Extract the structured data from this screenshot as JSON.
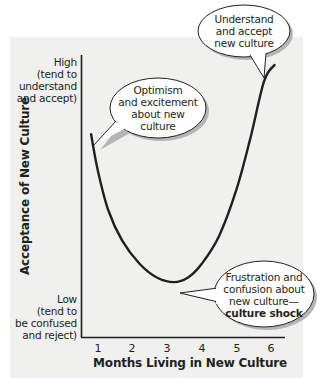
{
  "chart_data": {
    "type": "line",
    "title": "",
    "xlabel": "Months Living in New Culture",
    "ylabel": "Acceptance of New Culture",
    "x_ticks": [
      "1",
      "2",
      "3",
      "4",
      "5",
      "6"
    ],
    "xlim": [
      0.7,
      6.3
    ],
    "ylim": [
      0,
      10
    ],
    "y_tick_labels": {
      "high": [
        "High",
        "(tend to",
        "understand",
        "and accept)"
      ],
      "low": [
        "Low",
        "(tend to",
        "be confused",
        "and reject)"
      ]
    },
    "grid": false,
    "legend": null,
    "series": [
      {
        "name": "Acceptance of New Culture",
        "x": [
          0.8,
          1.0,
          1.3,
          1.7,
          2.2,
          2.7,
          3.2,
          3.6,
          4.0,
          4.5,
          5.0,
          5.4,
          5.8,
          6.1
        ],
        "y": [
          7.0,
          5.4,
          3.7,
          2.4,
          1.4,
          0.8,
          0.6,
          0.8,
          1.4,
          2.6,
          4.6,
          6.8,
          9.3,
          10.0
        ]
      }
    ],
    "annotations": [
      {
        "id": "optimism",
        "lines": [
          "Optimism",
          "and excitement",
          "about new",
          "culture"
        ],
        "points_to": [
          0.8,
          7.0
        ]
      },
      {
        "id": "understand",
        "lines": [
          "Understand",
          "and accept",
          "new culture"
        ],
        "points_to": [
          5.85,
          9.5
        ]
      },
      {
        "id": "frustration",
        "lines": [
          "Frustration and",
          "confusion about",
          "new culture—"
        ],
        "bold_line": "culture shock",
        "points_to": [
          3.3,
          0.6
        ]
      }
    ]
  },
  "colors": {
    "panel_bg": "#f0f0ef",
    "ink": "#231f20",
    "bubble_fill": "#ffffff",
    "bubble_shadow": "#b5b5b5"
  }
}
